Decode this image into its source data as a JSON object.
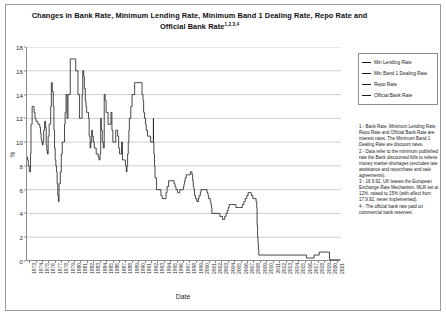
{
  "chart_data": {
    "type": "line",
    "title": "Changes in Bank Rate, Minimum Lending Rate, Minimum Band 1 Dealing Rate, Repo Rate and Official Bank Rate",
    "title_superscript": "1,2,3,4",
    "xlabel": "Date",
    "ylabel": "%",
    "ylim": [
      0,
      18
    ],
    "y_ticks": [
      0,
      2,
      4,
      6,
      8,
      10,
      12,
      14,
      16,
      18
    ],
    "grid": true,
    "grid_axis": "y",
    "legend_position": "top-right",
    "x_tick_labels": [
      "1973",
      "1974",
      "1975",
      "1976",
      "1977",
      "1978",
      "1979",
      "1980",
      "1981",
      "1982",
      "1983",
      "1984",
      "1985",
      "1986",
      "1987",
      "1988",
      "1989",
      "1990",
      "1991",
      "1992",
      "1993",
      "1994",
      "1995",
      "1996",
      "1997",
      "1998",
      "1999",
      "2000",
      "2001",
      "2002",
      "2003",
      "2004",
      "2005",
      "2006",
      "2007",
      "2008",
      "2009",
      "2010",
      "2011",
      "2012",
      "2013",
      "2014",
      "2015",
      "2016",
      "2017",
      "2018",
      "2019",
      "2020",
      "2021"
    ],
    "series": [
      {
        "name": "Min Lending Rate",
        "color": "#1a1a1a",
        "points": [
          [
            1973.0,
            8.75
          ],
          [
            1973.1,
            8.5
          ],
          [
            1973.2,
            8.0
          ],
          [
            1973.35,
            7.5
          ],
          [
            1973.5,
            7.5
          ],
          [
            1973.55,
            9.0
          ],
          [
            1973.62,
            11.5
          ],
          [
            1973.75,
            11.5
          ],
          [
            1973.8,
            13.0
          ],
          [
            1973.95,
            13.0
          ],
          [
            1974.1,
            12.5
          ],
          [
            1974.25,
            12.0
          ],
          [
            1974.4,
            11.75
          ],
          [
            1974.55,
            11.75
          ],
          [
            1974.7,
            11.5
          ],
          [
            1974.85,
            11.5
          ],
          [
            1975.0,
            11.25
          ],
          [
            1975.1,
            10.75
          ],
          [
            1975.2,
            10.25
          ],
          [
            1975.3,
            10.0
          ],
          [
            1975.4,
            9.75
          ],
          [
            1975.5,
            10.0
          ],
          [
            1975.6,
            11.0
          ],
          [
            1975.75,
            11.75
          ],
          [
            1975.9,
            11.25
          ],
          [
            1976.0,
            9.75
          ],
          [
            1976.1,
            9.25
          ],
          [
            1976.2,
            9.0
          ],
          [
            1976.3,
            10.5
          ],
          [
            1976.45,
            11.5
          ],
          [
            1976.6,
            11.5
          ],
          [
            1976.7,
            13.0
          ],
          [
            1976.8,
            15.0
          ],
          [
            1976.95,
            14.25
          ],
          [
            1977.1,
            13.0
          ],
          [
            1977.2,
            11.0
          ],
          [
            1977.3,
            9.5
          ],
          [
            1977.4,
            8.5
          ],
          [
            1977.5,
            8.0
          ],
          [
            1977.6,
            7.5
          ],
          [
            1977.7,
            6.5
          ],
          [
            1977.8,
            5.5
          ],
          [
            1977.9,
            5.0
          ],
          [
            1978.0,
            6.5
          ],
          [
            1978.2,
            7.5
          ],
          [
            1978.35,
            9.0
          ],
          [
            1978.5,
            10.0
          ],
          [
            1978.7,
            10.0
          ],
          [
            1978.85,
            11.5
          ],
          [
            1978.95,
            12.5
          ],
          [
            1979.1,
            14.0
          ],
          [
            1979.25,
            12.0
          ],
          [
            1979.4,
            14.0
          ],
          [
            1979.55,
            14.0
          ],
          [
            1979.75,
            17.0
          ],
          [
            1979.9,
            17.0
          ],
          [
            1980.2,
            17.0
          ],
          [
            1980.5,
            17.0
          ],
          [
            1980.6,
            16.0
          ],
          [
            1980.8,
            16.0
          ],
          [
            1980.95,
            14.0
          ],
          [
            1981.1,
            14.0
          ],
          [
            1981.2,
            12.0
          ],
          [
            1981.35,
            12.0
          ],
          [
            1981.5,
            12.0
          ],
          [
            1981.6,
            14.0
          ],
          [
            1981.7,
            16.0
          ],
          [
            1981.85,
            15.5
          ],
          [
            1981.95,
            14.5
          ]
        ]
      },
      {
        "name": "Min Band 1 Dealing Rate",
        "color": "#1a1a1a",
        "points": [
          [
            1981.95,
            14.5
          ],
          [
            1982.1,
            13.5
          ],
          [
            1982.2,
            13.0
          ],
          [
            1982.3,
            12.5
          ],
          [
            1982.45,
            12.5
          ],
          [
            1982.6,
            12.0
          ],
          [
            1982.7,
            10.5
          ],
          [
            1982.85,
            9.5
          ],
          [
            1982.95,
            10.0
          ],
          [
            1983.1,
            11.0
          ],
          [
            1983.2,
            10.5
          ],
          [
            1983.35,
            10.0
          ],
          [
            1983.5,
            9.5
          ],
          [
            1983.65,
            9.5
          ],
          [
            1983.8,
            9.0
          ],
          [
            1983.95,
            9.0
          ],
          [
            1984.1,
            8.75
          ],
          [
            1984.25,
            8.5
          ],
          [
            1984.4,
            9.0
          ],
          [
            1984.5,
            12.0
          ],
          [
            1984.6,
            11.0
          ],
          [
            1984.75,
            10.0
          ],
          [
            1984.9,
            9.5
          ],
          [
            1985.05,
            14.0
          ],
          [
            1985.2,
            13.5
          ],
          [
            1985.35,
            12.5
          ],
          [
            1985.5,
            12.5
          ],
          [
            1985.65,
            11.5
          ],
          [
            1985.8,
            11.5
          ],
          [
            1985.95,
            11.5
          ],
          [
            1986.1,
            12.5
          ],
          [
            1986.25,
            11.0
          ],
          [
            1986.4,
            10.0
          ],
          [
            1986.55,
            10.0
          ],
          [
            1986.7,
            10.0
          ],
          [
            1986.85,
            11.0
          ],
          [
            1987.0,
            11.0
          ],
          [
            1987.15,
            10.5
          ],
          [
            1987.3,
            9.5
          ],
          [
            1987.45,
            9.0
          ],
          [
            1987.6,
            9.0
          ],
          [
            1987.75,
            10.0
          ],
          [
            1987.9,
            8.5
          ],
          [
            1988.05,
            8.5
          ],
          [
            1988.2,
            8.5
          ],
          [
            1988.35,
            8.0
          ],
          [
            1988.5,
            7.5
          ],
          [
            1988.6,
            8.0
          ],
          [
            1988.7,
            9.0
          ],
          [
            1988.8,
            10.0
          ],
          [
            1988.9,
            11.0
          ],
          [
            1988.97,
            12.0
          ],
          [
            1989.2,
            13.0
          ],
          [
            1989.4,
            14.0
          ],
          [
            1989.8,
            15.0
          ],
          [
            1990.3,
            15.0
          ],
          [
            1990.8,
            15.0
          ],
          [
            1990.95,
            14.0
          ],
          [
            1991.1,
            13.5
          ],
          [
            1991.2,
            12.5
          ],
          [
            1991.35,
            12.0
          ],
          [
            1991.5,
            11.5
          ],
          [
            1991.6,
            11.0
          ],
          [
            1991.8,
            10.5
          ],
          [
            1991.95,
            10.5
          ],
          [
            1992.3,
            10.0
          ],
          [
            1992.6,
            10.0
          ],
          [
            1992.72,
            12.0
          ],
          [
            1992.74,
            10.0
          ],
          [
            1992.8,
            9.0
          ],
          [
            1992.9,
            8.0
          ],
          [
            1992.97,
            7.0
          ],
          [
            1993.2,
            6.0
          ],
          [
            1993.9,
            5.5
          ],
          [
            1994.1,
            5.25
          ],
          [
            1994.6,
            5.25
          ],
          [
            1994.7,
            5.75
          ],
          [
            1994.85,
            6.25
          ],
          [
            1995.1,
            6.75
          ],
          [
            1995.5,
            6.75
          ]
        ]
      },
      {
        "name": "Repo Rate",
        "color": "#1a1a1a",
        "points": [
          [
            1995.5,
            6.75
          ],
          [
            1995.95,
            6.5
          ],
          [
            1996.1,
            6.25
          ],
          [
            1996.25,
            6.0
          ],
          [
            1996.5,
            5.75
          ],
          [
            1996.7,
            5.75
          ],
          [
            1996.85,
            6.0
          ],
          [
            1997.05,
            6.0
          ],
          [
            1997.4,
            6.25
          ],
          [
            1997.5,
            6.5
          ],
          [
            1997.6,
            6.75
          ],
          [
            1997.7,
            7.0
          ],
          [
            1997.85,
            7.25
          ],
          [
            1998.1,
            7.25
          ],
          [
            1998.5,
            7.5
          ],
          [
            1998.75,
            7.25
          ],
          [
            1998.85,
            6.75
          ],
          [
            1998.95,
            6.25
          ],
          [
            1999.05,
            6.0
          ],
          [
            1999.15,
            5.5
          ],
          [
            1999.3,
            5.25
          ],
          [
            1999.5,
            5.0
          ],
          [
            1999.75,
            5.25
          ],
          [
            1999.85,
            5.5
          ],
          [
            2000.05,
            5.75
          ],
          [
            2000.15,
            6.0
          ],
          [
            2000.85,
            6.0
          ],
          [
            2001.1,
            5.75
          ],
          [
            2001.25,
            5.5
          ],
          [
            2001.35,
            5.25
          ],
          [
            2001.6,
            5.0
          ],
          [
            2001.7,
            4.75
          ],
          [
            2001.78,
            4.5
          ],
          [
            2001.85,
            4.0
          ],
          [
            2002.0,
            4.0
          ],
          [
            2002.9,
            4.0
          ],
          [
            2003.1,
            3.75
          ],
          [
            2003.5,
            3.5
          ],
          [
            2003.85,
            3.75
          ],
          [
            2004.05,
            4.0
          ],
          [
            2004.25,
            4.25
          ],
          [
            2004.4,
            4.5
          ],
          [
            2004.55,
            4.75
          ],
          [
            2004.95,
            4.75
          ],
          [
            2005.6,
            4.5
          ],
          [
            2006.0,
            4.5
          ],
          [
            2006.6,
            4.75
          ],
          [
            2006.85,
            5.0
          ]
        ]
      },
      {
        "name": "Official Bank Rate",
        "color": "#1a1a1a",
        "points": [
          [
            2006.85,
            5.0
          ],
          [
            2007.05,
            5.25
          ],
          [
            2007.3,
            5.5
          ],
          [
            2007.5,
            5.75
          ],
          [
            2007.95,
            5.75
          ],
          [
            2008.0,
            5.5
          ],
          [
            2008.25,
            5.25
          ],
          [
            2008.75,
            5.0
          ],
          [
            2008.85,
            4.5
          ],
          [
            2008.9,
            3.0
          ],
          [
            2008.98,
            2.0
          ],
          [
            2009.05,
            1.5
          ],
          [
            2009.1,
            1.0
          ],
          [
            2009.17,
            0.5
          ],
          [
            2010.0,
            0.5
          ],
          [
            2012.0,
            0.5
          ],
          [
            2014.0,
            0.5
          ],
          [
            2016.0,
            0.5
          ],
          [
            2016.6,
            0.25
          ],
          [
            2017.8,
            0.5
          ],
          [
            2018.6,
            0.75
          ],
          [
            2020.15,
            0.75
          ],
          [
            2020.2,
            0.25
          ],
          [
            2020.25,
            0.1
          ],
          [
            2021.9,
            0.1
          ]
        ]
      }
    ],
    "annotations": []
  },
  "legend": {
    "items": [
      {
        "label": "Min Lending Rate"
      },
      {
        "label": "Min Band 1 Dealing Rate"
      },
      {
        "label": "Repo Rate"
      },
      {
        "label": "Official Bank Rate"
      }
    ]
  },
  "footnotes": [
    "1 - Bank Rate, Minimum Lending Rate, Repo Rate and Official Bank Rate are interest rates. The Minimum Band 1 Dealing Rate are discount rates.",
    "2 - Data refer to the minimum published rate the Bank discounted bills to relieve money market shortages (excludes late assistance and repurchase and sale agreements).",
    "3 - 16.9.92, UK leaves the European Exchange Rate Mechanism. MLR set at 12%, raised to 15% (with affect from 17.9.92, never implemented).",
    "4 - The official bank rate paid on commercial bank reserves."
  ]
}
